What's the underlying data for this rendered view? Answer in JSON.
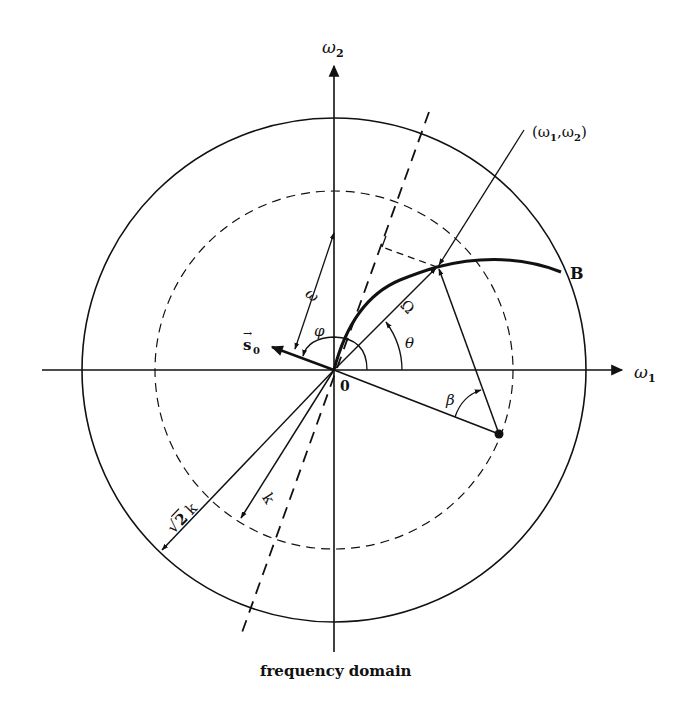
{
  "figure": {
    "caption": "frequency domain",
    "colors": {
      "ink": "#111111",
      "background": "#ffffff"
    },
    "labels": {
      "axis_x": "ω",
      "axis_x_sub": "1",
      "axis_y": "ω",
      "axis_y_sub": "2",
      "point": "(ω",
      "point_sub1": "1",
      "point_mid": ",ω",
      "point_sub2": "2",
      "point_close": ")",
      "curve_end": "B",
      "origin": "0",
      "omega_vec": "ω",
      "Omega": "Ω",
      "theta": "θ",
      "phi": "φ",
      "beta": "β",
      "s0": "s",
      "s0_sub": "0",
      "s0_arrow": "→",
      "k": "k",
      "sqrt2k_root": "√",
      "sqrt2k_num": "2",
      "sqrt2k_k": "k"
    },
    "geometry": {
      "center": [
        334,
        370
      ],
      "outer_radius": 252,
      "inner_radius_dashed": 179,
      "point_w1w2": [
        437,
        267
      ],
      "curve_end_B": [
        561,
        272
      ],
      "beta_point": [
        499,
        434
      ]
    }
  }
}
